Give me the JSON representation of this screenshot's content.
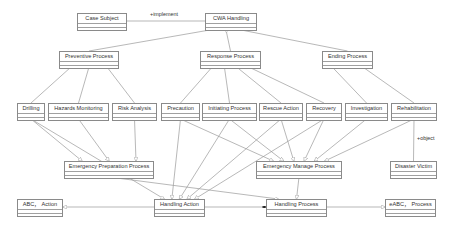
{
  "diagram": {
    "type": "UML class diagram",
    "classes": [
      {
        "id": "case_subject",
        "label": "Case Subject",
        "x": 77,
        "y": 13,
        "w": 50
      },
      {
        "id": "cwa_handling",
        "label": "CWA Handling",
        "x": 205,
        "y": 13,
        "w": 52
      },
      {
        "id": "preventive_process",
        "label": "Preventive Process",
        "x": 59,
        "y": 51,
        "w": 60
      },
      {
        "id": "response_process",
        "label": "Response Process",
        "x": 200,
        "y": 51,
        "w": 61
      },
      {
        "id": "ending_process",
        "label": "Ending Process",
        "x": 322,
        "y": 51,
        "w": 51
      },
      {
        "id": "drilling",
        "label": "Drilling",
        "x": 17,
        "y": 103,
        "w": 28
      },
      {
        "id": "hazards_monitoring",
        "label": "Hazards Monitoring",
        "x": 48,
        "y": 103,
        "w": 61
      },
      {
        "id": "risk_analysis",
        "label": "Risk Analysis",
        "x": 112,
        "y": 103,
        "w": 45
      },
      {
        "id": "precaution",
        "label": "Precaution",
        "x": 161,
        "y": 103,
        "w": 39
      },
      {
        "id": "initiating_process",
        "label": "Initiating Process",
        "x": 202,
        "y": 103,
        "w": 55
      },
      {
        "id": "rescue_action",
        "label": "Rescue Action",
        "x": 259,
        "y": 103,
        "w": 44
      },
      {
        "id": "recovery",
        "label": "Recovery",
        "x": 306,
        "y": 103,
        "w": 36
      },
      {
        "id": "investigation",
        "label": "Investigation",
        "x": 345,
        "y": 103,
        "w": 43
      },
      {
        "id": "rehabilitation",
        "label": "Rehabilitation",
        "x": 391,
        "y": 103,
        "w": 46
      },
      {
        "id": "emergency_preparation_process",
        "label": "Emergency Preparation Process",
        "x": 64,
        "y": 161,
        "w": 90
      },
      {
        "id": "emergency_manage_process",
        "label": "Emergency Manage Process",
        "x": 256,
        "y": 161,
        "w": 86
      },
      {
        "id": "disaster_victim",
        "label": "Disaster Victim",
        "x": 390,
        "y": 161,
        "w": 47
      },
      {
        "id": "abc_action",
        "label": "ABC， Action",
        "x": 17,
        "y": 199,
        "w": 46
      },
      {
        "id": "handling_action",
        "label": "Handling Action",
        "x": 154,
        "y": 199,
        "w": 51
      },
      {
        "id": "handling_process",
        "label": "Handling Process",
        "x": 266,
        "y": 199,
        "w": 61
      },
      {
        "id": "eabc_process",
        "label": "eABC， Process",
        "x": 385,
        "y": 199,
        "w": 51
      }
    ],
    "labels": [
      {
        "id": "implement_label",
        "text": "+implement",
        "x": 150,
        "y": 13
      },
      {
        "id": "object_label",
        "text": "+object",
        "x": 417,
        "y": 137
      }
    ],
    "edges": [
      {
        "from": "case_subject",
        "to": "cwa_handling",
        "kind": "association",
        "label": "+implement"
      },
      {
        "from": "preventive_process",
        "to": "cwa_handling",
        "kind": "aggregation"
      },
      {
        "from": "response_process",
        "to": "cwa_handling",
        "kind": "aggregation"
      },
      {
        "from": "ending_process",
        "to": "cwa_handling",
        "kind": "aggregation"
      },
      {
        "from": "drilling",
        "to": "preventive_process",
        "kind": "association"
      },
      {
        "from": "hazards_monitoring",
        "to": "preventive_process",
        "kind": "association"
      },
      {
        "from": "risk_analysis",
        "to": "preventive_process",
        "kind": "association"
      },
      {
        "from": "precaution",
        "to": "response_process",
        "kind": "association"
      },
      {
        "from": "initiating_process",
        "to": "response_process",
        "kind": "association"
      },
      {
        "from": "rescue_action",
        "to": "response_process",
        "kind": "association"
      },
      {
        "from": "recovery",
        "to": "response_process",
        "kind": "association"
      },
      {
        "from": "investigation",
        "to": "ending_process",
        "kind": "association"
      },
      {
        "from": "rehabilitation",
        "to": "ending_process",
        "kind": "association"
      },
      {
        "from": "rehabilitation",
        "to": "disaster_victim",
        "kind": "association",
        "label": "+object"
      },
      {
        "from": "drilling",
        "to": "emergency_preparation_process",
        "kind": "generalization"
      },
      {
        "from": "hazards_monitoring",
        "to": "emergency_preparation_process",
        "kind": "generalization"
      },
      {
        "from": "risk_analysis",
        "to": "emergency_preparation_process",
        "kind": "generalization"
      },
      {
        "from": "precaution",
        "to": "emergency_manage_process",
        "kind": "generalization"
      },
      {
        "from": "initiating_process",
        "to": "emergency_manage_process",
        "kind": "generalization"
      },
      {
        "from": "rescue_action",
        "to": "emergency_manage_process",
        "kind": "generalization"
      },
      {
        "from": "recovery",
        "to": "emergency_manage_process",
        "kind": "generalization"
      },
      {
        "from": "investigation",
        "to": "emergency_manage_process",
        "kind": "generalization"
      },
      {
        "from": "rehabilitation",
        "to": "emergency_manage_process",
        "kind": "generalization"
      },
      {
        "from": "drilling",
        "to": "handling_action",
        "kind": "generalization"
      },
      {
        "from": "precaution",
        "to": "handling_action",
        "kind": "generalization"
      },
      {
        "from": "initiating_process",
        "to": "handling_action",
        "kind": "generalization"
      },
      {
        "from": "rescue_action",
        "to": "handling_action",
        "kind": "generalization"
      },
      {
        "from": "recovery",
        "to": "handling_action",
        "kind": "generalization"
      },
      {
        "from": "emergency_preparation_process",
        "to": "handling_process",
        "kind": "generalization"
      },
      {
        "from": "emergency_manage_process",
        "to": "handling_process",
        "kind": "generalization"
      },
      {
        "from": "handling_action",
        "to": "abc_action",
        "kind": "generalization"
      },
      {
        "from": "handling_action",
        "to": "handling_process",
        "kind": "composition"
      },
      {
        "from": "handling_process",
        "to": "eabc_process",
        "kind": "generalization"
      }
    ]
  },
  "colors": {
    "line": "#9a9a9a",
    "box_border": "#8a8a8a",
    "text": "#333333",
    "background": "#ffffff"
  }
}
